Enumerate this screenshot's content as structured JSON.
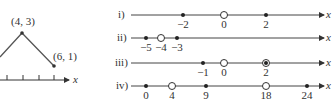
{
  "left_graph": {
    "points": [
      {
        "label": "(4, 3)"
      },
      {
        "label": "(6, 1)"
      }
    ],
    "axis_label": "x"
  },
  "number_lines": [
    {
      "label": "i)",
      "axis_label": "x",
      "marks": [
        {
          "value": "−2",
          "type": "closed"
        },
        {
          "value": "0",
          "type": "open"
        },
        {
          "value": "2",
          "type": "closed"
        }
      ]
    },
    {
      "label": "ii)",
      "axis_label": "x",
      "marks": [
        {
          "value": "−5",
          "type": "closed"
        },
        {
          "value": "−4",
          "type": "open"
        },
        {
          "value": "−3",
          "type": "closed"
        }
      ]
    },
    {
      "label": "iii)",
      "axis_label": "x",
      "marks": [
        {
          "value": "−1",
          "type": "closed"
        },
        {
          "value": "0",
          "type": "open"
        },
        {
          "value": "2",
          "type": "open-with-dot"
        }
      ]
    },
    {
      "label": "iv)",
      "axis_label": "x",
      "marks": [
        {
          "value": "0",
          "type": "closed"
        },
        {
          "value": "4",
          "type": "open"
        },
        {
          "value": "9",
          "type": "closed"
        },
        {
          "value": "18",
          "type": "open"
        },
        {
          "value": "24",
          "type": "closed"
        }
      ]
    }
  ]
}
